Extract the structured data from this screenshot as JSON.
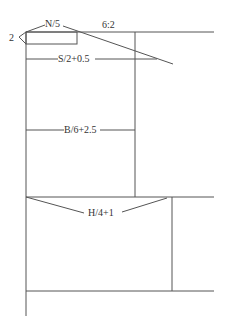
{
  "diagram": {
    "title": "",
    "line_color": "#555555",
    "text_color": "#333333",
    "labels": {
      "corner": "2",
      "neck": "N/5",
      "slope": "6:2",
      "shoulder": "S/2+0.5",
      "back": "B/6+2.5",
      "hip": "H/4+1"
    }
  }
}
